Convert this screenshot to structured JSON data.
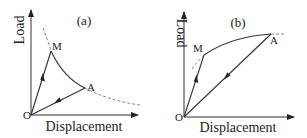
{
  "figure": {
    "panels": [
      {
        "id": "a",
        "label": "(a)",
        "y_axis_label": "Load",
        "x_axis_label": "Displacement",
        "origin_label": "O",
        "points": {
          "M": "M",
          "A": "A"
        }
      },
      {
        "id": "b",
        "label": "(b)",
        "y_axis_label": "Load",
        "x_axis_label": "Displacement",
        "origin_label": "O",
        "points": {
          "M": "M",
          "A": "A"
        }
      }
    ]
  },
  "colors": {
    "line": "#333333",
    "dashed": "#777777",
    "text": "#222222",
    "background": "#ffffff"
  }
}
